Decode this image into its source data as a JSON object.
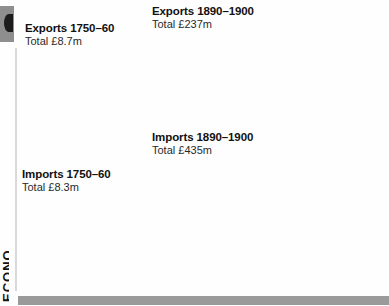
{
  "page": {
    "background": "#fefefe",
    "edge_tab_color": "#8e8e8e",
    "footer_bar_color": "#9a9a9a",
    "vertical_edge_text": "ECONO"
  },
  "palette": {
    "light": "#ececec",
    "light2": "#e3e3e3",
    "mid": "#c9c9c9",
    "mid_dark": "#a8a8a8",
    "dark": "#8a8a8a",
    "darker": "#6e6e6e",
    "outline": "#111111"
  },
  "charts": [
    {
      "id": "exports-1750-60",
      "title": "Exports 1750–60",
      "subtitle": "Total £8.7m",
      "type": "pie",
      "total_label": "£8.7m",
      "cx": 80,
      "cy": 97,
      "r": 23,
      "slices": [
        {
          "label": "Woollens",
          "value": 50.0,
          "color": "#dddddd",
          "label_pos": "out-right",
          "lx": 113,
          "ly": 96,
          "anchor": "start",
          "leader": [
            [
              103,
              96
            ],
            [
              110,
              96
            ]
          ]
        },
        {
          "label": "Iron & steel",
          "value": 4.5,
          "color": "#9a9a9a",
          "label_pos": "out-right",
          "lx": 113,
          "ly": 125,
          "anchor": "start",
          "leader": [
            [
              80,
              120
            ],
            [
              80,
              124
            ],
            [
              110,
              124
            ]
          ]
        },
        {
          "label": "Other exports",
          "value": 45.5,
          "color": "#efefef",
          "label_pos": "out-left",
          "lx": 12,
          "ly": 93,
          "anchor": "start",
          "leader": [
            [
              47,
              96
            ],
            [
              57,
              96
            ]
          ]
        }
      ],
      "legend_lines": {
        "Other exports": [
          "Other",
          "exports"
        ]
      }
    },
    {
      "id": "imports-1750-60",
      "title": "Imports 1750–60",
      "subtitle": "Total £8.3m",
      "type": "pie",
      "total_label": "£8.3m",
      "cx": 80,
      "cy": 243,
      "r": 23,
      "slices": [
        {
          "label": "Groceries & grain",
          "value": 28.0,
          "color": "#d2d2d2",
          "label_pos": "out-right",
          "lx": 113,
          "ly": 228,
          "anchor": "start",
          "leader": [
            [
              99,
              231
            ],
            [
              110,
              227
            ]
          ]
        },
        {
          "label": "Raw cotton",
          "value": 13.0,
          "color": "#a5a5a5",
          "label_pos": "out-right",
          "lx": 113,
          "ly": 255,
          "anchor": "start",
          "leader": [
            [
              97,
              253
            ],
            [
              110,
              253
            ]
          ]
        },
        {
          "label": "Other imports",
          "value": 59.0,
          "color": "#efefef",
          "label_pos": "out-left",
          "lx": 12,
          "ly": 240,
          "anchor": "start",
          "leader": [
            [
              47,
              243
            ],
            [
              57,
              243
            ]
          ]
        }
      ],
      "legend_lines": {
        "Groceries & grain": [
          "Groceries",
          "& grain"
        ],
        "Other imports": [
          "Other",
          "imports"
        ]
      }
    },
    {
      "id": "exports-1890-1900",
      "title": "Exports 1890–1900",
      "subtitle": "Total £237m",
      "type": "pie",
      "total_label": "£237m",
      "cx": 312,
      "cy": 76,
      "r": 45,
      "slices": [
        {
          "label": "Cottons",
          "value": 27.0,
          "color": "#e6e6e6",
          "label_pos": "in",
          "lx": 337,
          "ly": 50
        },
        {
          "label": "Iron & steel",
          "value": 14.0,
          "color": "#b4b4b4",
          "label_pos": "in",
          "lx": 334,
          "ly": 91
        },
        {
          "label": "Machinery",
          "value": 4.0,
          "color": "#9c9c9c",
          "label_pos": "out-right",
          "lx": 351,
          "ly": 127,
          "anchor": "start",
          "leader": [
            [
              314,
              121
            ],
            [
              348,
              124
            ]
          ]
        },
        {
          "label": "Coal",
          "value": 9.0,
          "color": "#7e7e7e",
          "label_pos": "in",
          "lx": 292,
          "ly": 116
        },
        {
          "label": "Other exports",
          "value": 46.0,
          "color": "#efefef",
          "label_pos": "in",
          "lx": 282,
          "ly": 68
        }
      ],
      "legend_lines": {
        "Other exports": [
          "Other",
          "exports"
        ]
      }
    },
    {
      "id": "imports-1890-1900",
      "title": "Imports 1890–1900",
      "subtitle": "Total £435m",
      "type": "pie",
      "total_label": "£435m",
      "cx": 300,
      "cy": 216,
      "r": 53,
      "slices": [
        {
          "label": "Groceries & grain",
          "value": 25.0,
          "color": "#d2d2d2",
          "label_pos": "in",
          "lx": 330,
          "ly": 185
        },
        {
          "label": "Raw cotton",
          "value": 20.0,
          "color": "#a9a9a9",
          "label_pos": "in",
          "lx": 335,
          "ly": 228
        },
        {
          "label": "Meat & dairy",
          "value": 11.0,
          "color": "#c4c4c4",
          "label_pos": "in",
          "lx": 301,
          "ly": 258
        },
        {
          "label": "Manufactured goods",
          "value": 5.0,
          "color": "#8e8e8e",
          "label_pos": "out-left",
          "lx": 190,
          "ly": 271,
          "anchor": "start",
          "leader": [
            [
              266,
              272
            ],
            [
              255,
              276
            ],
            [
              222,
              276
            ]
          ]
        },
        {
          "label": "Other imports",
          "value": 39.0,
          "color": "#f0f0f0",
          "label_pos": "in",
          "lx": 268,
          "ly": 208
        }
      ],
      "legend_lines": {
        "Groceries & grain": [
          "Groceries",
          "& grain"
        ],
        "Meat & dairy": [
          "Meat",
          "& dairy"
        ],
        "Manufactured goods": [
          "Manufactured",
          "goods"
        ],
        "Other imports": [
          "Other",
          "imports"
        ]
      }
    }
  ],
  "chart_data": [
    {
      "type": "pie",
      "title": "Exports 1750–60",
      "subtitle": "Total £8.7m",
      "categories": [
        "Woollens",
        "Iron & steel",
        "Other exports"
      ],
      "values": [
        50.0,
        4.5,
        45.5
      ],
      "units": "percent of £8.7m total",
      "legend_position": "callout-labels"
    },
    {
      "type": "pie",
      "title": "Imports 1750–60",
      "subtitle": "Total £8.3m",
      "categories": [
        "Groceries & grain",
        "Raw cotton",
        "Other imports"
      ],
      "values": [
        28.0,
        13.0,
        59.0
      ],
      "units": "percent of £8.3m total",
      "legend_position": "callout-labels"
    },
    {
      "type": "pie",
      "title": "Exports 1890–1900",
      "subtitle": "Total £237m",
      "categories": [
        "Cottons",
        "Iron & steel",
        "Machinery",
        "Coal",
        "Other exports"
      ],
      "values": [
        27.0,
        14.0,
        4.0,
        9.0,
        46.0
      ],
      "units": "percent of £237m total",
      "legend_position": "in-slice"
    },
    {
      "type": "pie",
      "title": "Imports 1890–1900",
      "subtitle": "Total £435m",
      "categories": [
        "Groceries & grain",
        "Raw cotton",
        "Meat & dairy",
        "Manufactured goods",
        "Other imports"
      ],
      "values": [
        25.0,
        20.0,
        11.0,
        5.0,
        39.0
      ],
      "units": "percent of £435m total",
      "legend_position": "in-slice"
    }
  ],
  "titles": {
    "exports_1750": {
      "title": "Exports 1750–60",
      "subtitle": "Total £8.7m",
      "x": 25,
      "y": 22
    },
    "imports_1750": {
      "title": "Imports 1750–60",
      "subtitle": "Total £8.3m",
      "x": 22,
      "y": 168
    },
    "exports_1890": {
      "title": "Exports 1890–1900",
      "subtitle": "Total £237m",
      "x": 152,
      "y": 5
    },
    "imports_1890": {
      "title": "Imports 1890–1900",
      "subtitle": "Total £435m",
      "x": 152,
      "y": 131
    }
  }
}
